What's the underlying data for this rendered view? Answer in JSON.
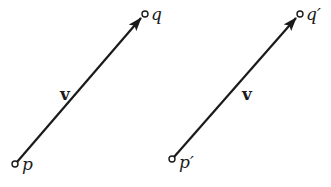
{
  "diagram": {
    "colors": {
      "ink": "#1a1a1a",
      "background": "#ffffff"
    },
    "vectors": [
      {
        "id": "left",
        "label": "v",
        "tail_label": "p",
        "head_label": "q"
      },
      {
        "id": "right",
        "label": "v",
        "tail_label": "p′",
        "head_label": "q′"
      }
    ]
  }
}
